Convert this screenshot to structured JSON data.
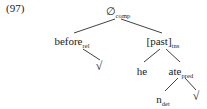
{
  "figure": {
    "example_number": "(97)",
    "type": "syntax-tree"
  },
  "tree": {
    "root": {
      "id": "root",
      "label": "∅",
      "subscript": "comp"
    },
    "nodes": [
      {
        "id": "before",
        "label": "before",
        "subscript": "rel"
      },
      {
        "id": "past",
        "label": "[past]",
        "subscript": "tns"
      },
      {
        "id": "he",
        "label": "he",
        "subscript": ""
      },
      {
        "id": "ate",
        "label": "ate",
        "subscript": "pred"
      },
      {
        "id": "ndet",
        "label": "n",
        "subscript": "det"
      }
    ],
    "radicals": [
      {
        "id": "radical-before",
        "glyph": "√",
        "parent": "before"
      },
      {
        "id": "radical-ate",
        "glyph": "√",
        "parent": "ate"
      }
    ],
    "edges": [
      {
        "from": "root",
        "to": "before"
      },
      {
        "from": "root",
        "to": "past"
      },
      {
        "from": "before",
        "to": "radical-before"
      },
      {
        "from": "past",
        "to": "he"
      },
      {
        "from": "past",
        "to": "ate"
      },
      {
        "from": "ate",
        "to": "ndet"
      },
      {
        "from": "ate",
        "to": "radical-ate"
      }
    ]
  },
  "colors": {
    "background": "#ffffff",
    "text": "#1a1a1a",
    "branch_line": "#2b2b2b"
  }
}
